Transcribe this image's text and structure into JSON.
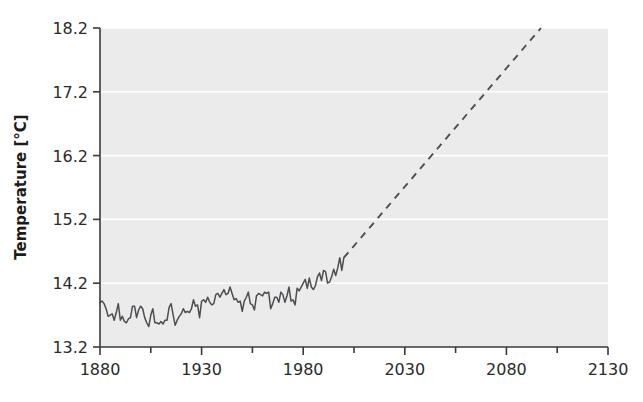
{
  "chart_data": {
    "type": "line",
    "title": "",
    "xlabel": "",
    "ylabel": "Temperature [°C]",
    "xlim": [
      1880,
      2130
    ],
    "ylim": [
      13.2,
      18.2
    ],
    "xticks": [
      1880,
      1930,
      1980,
      2030,
      2080,
      2130
    ],
    "xtick_labels": [
      "1880",
      "1930",
      "1980",
      "2030",
      "2080",
      "2130"
    ],
    "yticks": [
      13.2,
      14.2,
      15.2,
      16.2,
      17.2,
      18.2
    ],
    "ytick_labels": [
      "13.2",
      "14.2",
      "15.2",
      "16.2",
      "17.2",
      "18.2"
    ],
    "minor_xticks": [
      1905,
      1955,
      2005,
      2055,
      2105
    ],
    "grid": "horizontal-only, white gridlines on light gray panel",
    "legend": "none",
    "plot_background": "#ebebeb",
    "figure_background": "#ffffff",
    "line_color": "#4d4d52",
    "series": [
      {
        "name": "Observed global mean temperature",
        "style": "solid",
        "x": [
          1880,
          1881,
          1882,
          1883,
          1884,
          1885,
          1886,
          1887,
          1888,
          1889,
          1890,
          1891,
          1892,
          1893,
          1894,
          1895,
          1896,
          1897,
          1898,
          1899,
          1900,
          1901,
          1902,
          1903,
          1904,
          1905,
          1906,
          1907,
          1908,
          1909,
          1910,
          1911,
          1912,
          1913,
          1914,
          1915,
          1916,
          1917,
          1918,
          1919,
          1920,
          1921,
          1922,
          1923,
          1924,
          1925,
          1926,
          1927,
          1928,
          1929,
          1930,
          1931,
          1932,
          1933,
          1934,
          1935,
          1936,
          1937,
          1938,
          1939,
          1940,
          1941,
          1942,
          1943,
          1944,
          1945,
          1946,
          1947,
          1948,
          1949,
          1950,
          1951,
          1952,
          1953,
          1954,
          1955,
          1956,
          1957,
          1958,
          1959,
          1960,
          1961,
          1962,
          1963,
          1964,
          1965,
          1966,
          1967,
          1968,
          1969,
          1970,
          1971,
          1972,
          1973,
          1974,
          1975,
          1976,
          1977,
          1978,
          1979,
          1980,
          1981,
          1982,
          1983,
          1984,
          1985,
          1986,
          1987,
          1988,
          1989,
          1990,
          1991,
          1992,
          1993,
          1994,
          1995,
          1996,
          1997,
          1998,
          1999,
          2000
        ],
        "y": [
          13.9,
          13.92,
          13.88,
          13.8,
          13.68,
          13.7,
          13.72,
          13.62,
          13.74,
          13.88,
          13.62,
          13.68,
          13.6,
          13.58,
          13.64,
          13.66,
          13.84,
          13.84,
          13.66,
          13.78,
          13.84,
          13.8,
          13.66,
          13.58,
          13.52,
          13.7,
          13.8,
          13.58,
          13.58,
          13.56,
          13.6,
          13.56,
          13.62,
          13.62,
          13.82,
          13.88,
          13.7,
          13.54,
          13.62,
          13.68,
          13.72,
          13.8,
          13.74,
          13.76,
          13.74,
          13.8,
          13.94,
          13.84,
          13.86,
          13.66,
          13.92,
          13.94,
          13.9,
          13.98,
          13.9,
          13.86,
          13.88,
          14.02,
          14.04,
          13.98,
          14.04,
          14.1,
          14.02,
          14.04,
          14.14,
          14.04,
          13.94,
          13.96,
          13.9,
          13.92,
          13.76,
          13.92,
          13.98,
          14.06,
          13.88,
          13.86,
          13.78,
          14.0,
          14.04,
          14.02,
          14.0,
          14.06,
          14.04,
          14.06,
          13.8,
          13.88,
          13.98,
          13.98,
          13.9,
          14.06,
          14.02,
          13.9,
          14.0,
          14.14,
          13.92,
          13.94,
          13.86,
          14.12,
          14.08,
          14.14,
          14.2,
          14.26,
          14.12,
          14.28,
          14.14,
          14.1,
          14.16,
          14.3,
          14.36,
          14.24,
          14.4,
          14.38,
          14.2,
          14.22,
          14.3,
          14.42,
          14.32,
          14.44,
          14.6,
          14.4,
          14.6
        ]
      },
      {
        "name": "Projected warming",
        "style": "dashed",
        "x": [
          2000,
          2097
        ],
        "y": [
          14.6,
          18.2
        ]
      }
    ],
    "annotations": [
      "Solid jagged line: observed record 1880-2000, rising from about 13.6-13.9 °C early period to about 14.6 °C by 2000",
      "Dashed straight line: linear projection from 2000 (14.6 °C) to about 2097 (18.2 °C)"
    ]
  },
  "axes": {
    "y_title": "Temperature [°C]"
  }
}
